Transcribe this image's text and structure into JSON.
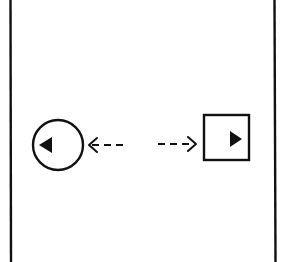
{
  "diagram": {
    "stroke_color": "#111111",
    "background_color": "#ffffff",
    "frame": {
      "left_line_x": 10,
      "right_line_x": 275
    },
    "left_node": {
      "shape": "circle",
      "icon": "triangle-left-icon",
      "cx": 58,
      "cy": 145,
      "r": 25
    },
    "right_node": {
      "shape": "square",
      "icon": "triangle-right-icon",
      "x": 204,
      "y": 115,
      "width": 45,
      "height": 45
    },
    "left_arrow": {
      "style": "dashed",
      "direction": "left",
      "from_x": 127,
      "to_x": 89,
      "y": 145
    },
    "right_arrow": {
      "style": "dashed",
      "direction": "right",
      "from_x": 158,
      "to_x": 196,
      "y": 144
    }
  }
}
